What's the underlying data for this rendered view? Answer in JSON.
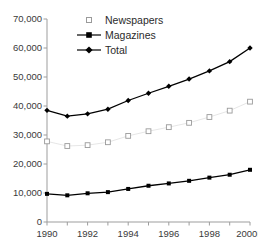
{
  "chart_data": {
    "type": "line",
    "title": "",
    "subtitle": "",
    "xlabel": "",
    "ylabel": "",
    "x": [
      1990,
      1991,
      1992,
      1993,
      1994,
      1995,
      1996,
      1997,
      1998,
      1999,
      2000
    ],
    "categories": [
      "1990",
      "1991",
      "1992",
      "1993",
      "1994",
      "1995",
      "1996",
      "1997",
      "1998",
      "1999",
      "2000E"
    ],
    "xtick_labels": [
      "1990",
      "1992",
      "1994",
      "1996",
      "1998",
      "2000E"
    ],
    "xtick_values": [
      1990,
      1992,
      1994,
      1996,
      1998,
      2000
    ],
    "xlim": [
      1990,
      2000
    ],
    "ylim": [
      0,
      70000
    ],
    "ytick_labels": [
      "0",
      "10,000",
      "20,000",
      "30,000",
      "40,000",
      "50,000",
      "60,000",
      "70,000"
    ],
    "ytick_values": [
      0,
      10000,
      20000,
      30000,
      40000,
      50000,
      60000,
      70000
    ],
    "grid": false,
    "legend_position": "upper-left-inside",
    "series": [
      {
        "name": "Newspapers",
        "marker": "open-square",
        "line_style": "faint",
        "color": "#9a9a9a",
        "values": [
          27800,
          26200,
          26500,
          27500,
          29700,
          31300,
          32700,
          34200,
          36200,
          38400,
          41500
        ]
      },
      {
        "name": "Magazines",
        "marker": "filled-square",
        "line_style": "solid",
        "color": "#000000",
        "values": [
          9700,
          9200,
          9900,
          10300,
          11400,
          12500,
          13300,
          14200,
          15300,
          16300,
          18000
        ]
      },
      {
        "name": "Total",
        "marker": "filled-diamond",
        "line_style": "solid",
        "color": "#000000",
        "values": [
          38500,
          36500,
          37300,
          38900,
          41900,
          44400,
          46800,
          49300,
          52100,
          55300,
          60000
        ]
      }
    ]
  },
  "legend": {
    "items": [
      {
        "label": "Newspapers",
        "icon": "open-square-marker-icon"
      },
      {
        "label": "Magazines",
        "icon": "line-filled-square-marker-icon"
      },
      {
        "label": "Total",
        "icon": "line-filled-diamond-marker-icon"
      }
    ]
  },
  "colors": {
    "axis": "#9d9d9d",
    "text": "#3a3a3a",
    "series_dark": "#000000",
    "series_light": "#9a9a9a",
    "background": "#ffffff"
  }
}
